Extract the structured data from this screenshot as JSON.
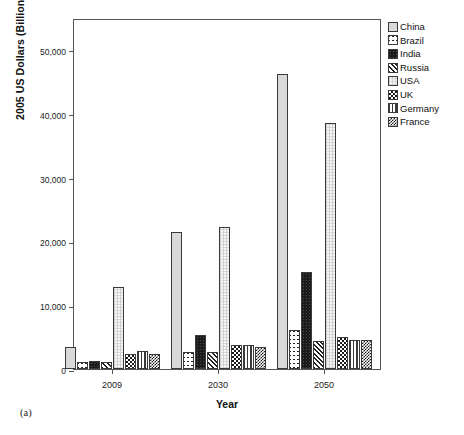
{
  "figure": {
    "caption": "(a)"
  },
  "chart_data": {
    "type": "bar",
    "title": "",
    "subtitle": "",
    "xlabel": "Year",
    "ylabel": "2005 US Dollars (Billion)",
    "categories": [
      "2009",
      "2030",
      "2050"
    ],
    "ylim": [
      0,
      55000
    ],
    "yticks": [
      0,
      10000,
      20000,
      30000,
      40000,
      50000
    ],
    "ytick_labels": [
      "0",
      "10,000",
      "20,000",
      "30,000",
      "40,000",
      "50,000"
    ],
    "grid": false,
    "legend_position": "right-outside",
    "series": [
      {
        "name": "China",
        "pattern": "light-grey-dotted",
        "values": [
          3500,
          21500,
          46300
        ]
      },
      {
        "name": "Brazil",
        "pattern": "sparse-star-cross",
        "values": [
          1100,
          2600,
          6100
        ]
      },
      {
        "name": "India",
        "pattern": "solid-black",
        "values": [
          1200,
          5400,
          15200
        ]
      },
      {
        "name": "Russia",
        "pattern": "diagonal-hatch",
        "values": [
          1100,
          2600,
          4400
        ]
      },
      {
        "name": "USA",
        "pattern": "white-fine-grid",
        "values": [
          12900,
          22300,
          38600
        ]
      },
      {
        "name": "UK",
        "pattern": "coarse-checker",
        "values": [
          2400,
          3700,
          5000
        ]
      },
      {
        "name": "Germany",
        "pattern": "vertical-stripes",
        "values": [
          2900,
          3700,
          4600
        ]
      },
      {
        "name": "France",
        "pattern": "fine-checker",
        "values": [
          2300,
          3400,
          4600
        ]
      }
    ]
  },
  "legend": {
    "items": [
      {
        "label": "China"
      },
      {
        "label": "Brazil"
      },
      {
        "label": "India"
      },
      {
        "label": "Russia"
      },
      {
        "label": "USA"
      },
      {
        "label": "UK"
      },
      {
        "label": "Germany"
      },
      {
        "label": "France"
      }
    ]
  }
}
